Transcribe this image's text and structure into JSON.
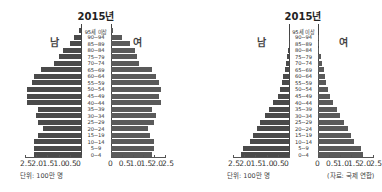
{
  "chart_data": [
    {
      "type": "bar",
      "subtype": "population-pyramid",
      "title": "2015년",
      "male_label": "남",
      "female_label": "여",
      "unit_note": "단위: 100만 명",
      "categories": [
        "0~4",
        "5~9",
        "10~14",
        "15~19",
        "20~24",
        "25~29",
        "30~34",
        "35~39",
        "40~44",
        "45~49",
        "50~54",
        "55~59",
        "60~64",
        "65~69",
        "70~74",
        "75~79",
        "80~84",
        "85~89",
        "90~94",
        "95세 이상"
      ],
      "series": [
        {
          "name": "남",
          "values": [
            2.1,
            2.1,
            2.1,
            1.9,
            1.7,
            1.9,
            2.0,
            1.9,
            2.4,
            2.4,
            2.4,
            2.2,
            2.1,
            1.8,
            1.2,
            1.0,
            0.8,
            0.5,
            0.3,
            0.1
          ]
        },
        {
          "name": "여",
          "values": [
            1.9,
            2.0,
            2.0,
            1.8,
            1.7,
            2.0,
            2.1,
            1.9,
            2.3,
            2.2,
            2.3,
            2.2,
            2.1,
            1.9,
            1.3,
            1.2,
            1.1,
            0.9,
            0.5,
            0.1
          ]
        }
      ],
      "x_ticks": [
        "2.5",
        "2.0",
        "1.5",
        "1.0",
        "0.5",
        "0"
      ],
      "x_ticks_female": [
        "0",
        "0.5",
        "1.0",
        "1.5",
        "2.0",
        "2.5"
      ],
      "xlim": [
        0,
        2.5
      ],
      "grid": false
    },
    {
      "type": "bar",
      "subtype": "population-pyramid",
      "title": "2015년",
      "male_label": "남",
      "female_label": "여",
      "unit_note": "단위: 100만 명",
      "source_note": "(자료: 국제 연합)",
      "categories": [
        "0~4",
        "5~9",
        "10~14",
        "15~19",
        "20~24",
        "25~29",
        "30~34",
        "35~39",
        "40~44",
        "45~49",
        "50~54",
        "55~59",
        "60~64",
        "65~69",
        "70~74",
        "75~79",
        "80~84",
        "85~89",
        "90~94",
        "95세 이상"
      ],
      "series": [
        {
          "name": "남",
          "values": [
            2.15,
            2.05,
            1.75,
            1.6,
            1.45,
            1.3,
            1.05,
            0.9,
            0.7,
            0.5,
            0.4,
            0.3,
            0.25,
            0.2,
            0.15,
            0.08,
            0.04,
            0.02,
            0.01,
            0.0
          ]
        },
        {
          "name": "여",
          "values": [
            2.05,
            1.95,
            1.65,
            1.5,
            1.35,
            1.2,
            1.0,
            0.85,
            0.7,
            0.55,
            0.45,
            0.35,
            0.3,
            0.25,
            0.2,
            0.12,
            0.06,
            0.03,
            0.01,
            0.0
          ]
        }
      ],
      "x_ticks": [
        "2.5",
        "2.0",
        "1.5",
        "1.0",
        "0.5",
        "0"
      ],
      "x_ticks_female": [
        "0",
        "0.5",
        "1.0",
        "1.5",
        "2.0",
        "2.5"
      ],
      "xlim": [
        0,
        2.5
      ],
      "grid": false
    }
  ]
}
